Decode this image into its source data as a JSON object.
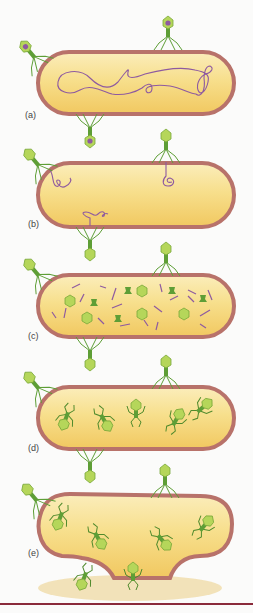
{
  "figure": {
    "colors": {
      "cell_wall": "#b8726a",
      "cytoplasm": "#f5d678",
      "cytoplasm_light": "#fbedbb",
      "phage_head": "#b5d65a",
      "phage_body": "#5e9e36",
      "dna": "#8e5aa0",
      "debris": "#efd9a3",
      "rule": "#8a2a3a"
    },
    "panels": [
      {
        "label": "(a)",
        "stage": "attachment",
        "dna": "host-chromosome"
      },
      {
        "label": "(b)",
        "stage": "injection",
        "dna": "phage-dna-injected"
      },
      {
        "label": "(c)",
        "stage": "synthesis",
        "dna": "fragments-and-parts"
      },
      {
        "label": "(d)",
        "stage": "assembly",
        "dna": "none"
      },
      {
        "label": "(e)",
        "stage": "lysis",
        "dna": "none"
      }
    ]
  }
}
